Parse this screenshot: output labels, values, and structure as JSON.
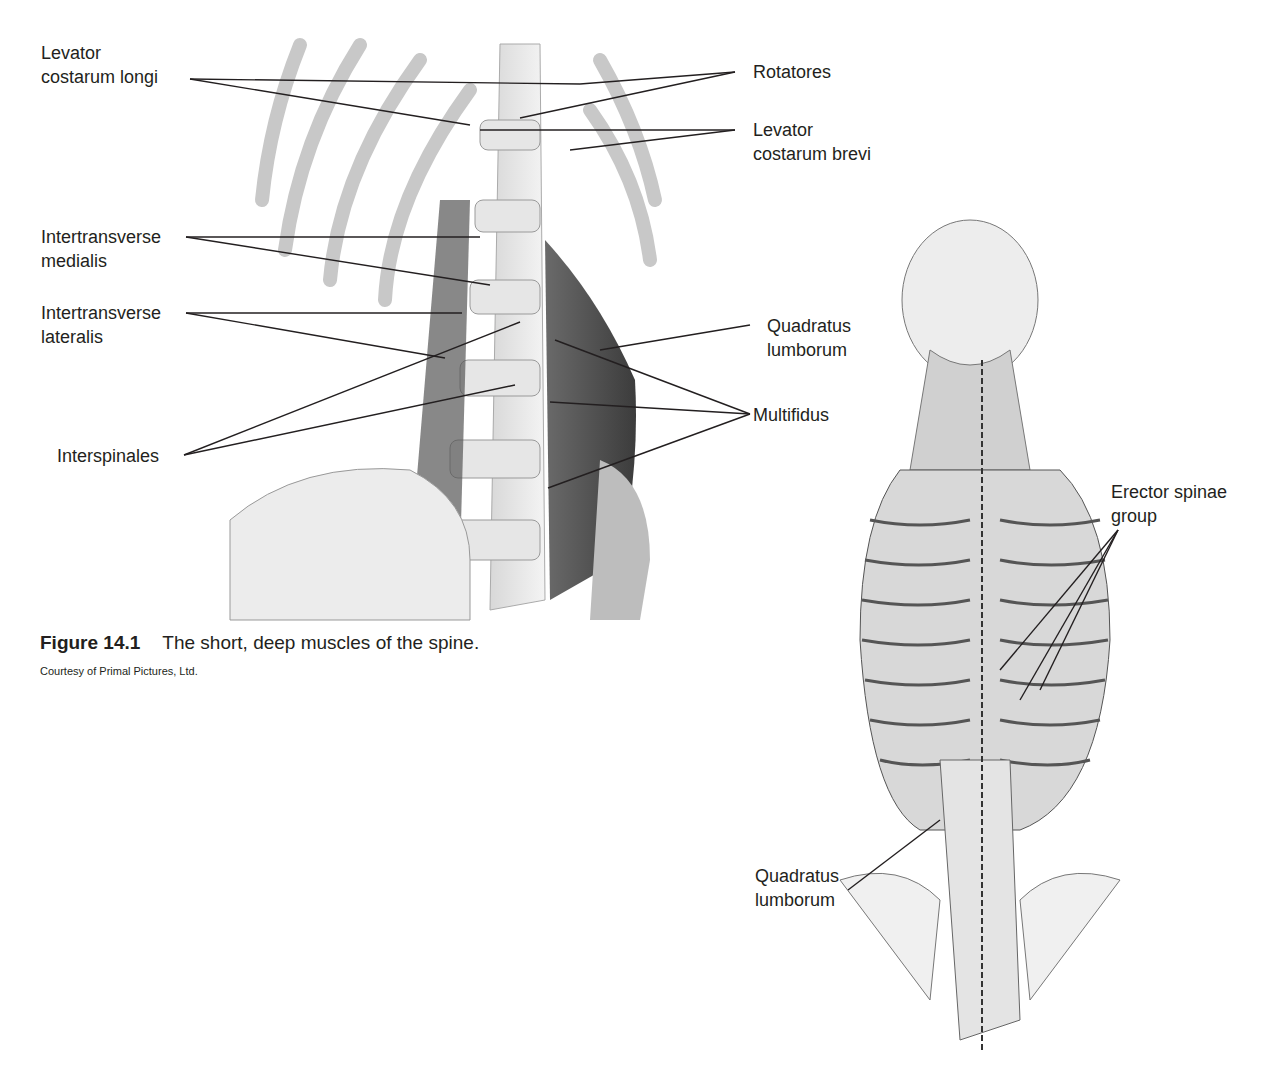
{
  "figure": {
    "number": "Figure 14.1",
    "caption": "The short, deep muscles of the spine.",
    "credit": "Courtesy of Primal Pictures, Ltd."
  },
  "left_diagram": {
    "labels": {
      "levator_costarum_longi": [
        "Levator",
        "costarum longi"
      ],
      "rotatores": [
        "Rotatores"
      ],
      "levator_costarum_brevi": [
        "Levator",
        "costarum brevi"
      ],
      "intertransverse_medialis": [
        "Intertransverse",
        "medialis"
      ],
      "intertransverse_lateralis": [
        "Intertransverse",
        "lateralis"
      ],
      "quadratus_lumborum": [
        "Quadratus",
        "lumborum"
      ],
      "multifidus": [
        "Multifidus"
      ],
      "interspinales": [
        "Interspinales"
      ]
    }
  },
  "right_diagram": {
    "labels": {
      "erector_spinae": [
        "Erector spinae",
        "group"
      ],
      "quadratus_lumborum": [
        "Quadratus",
        "lumborum"
      ]
    }
  }
}
